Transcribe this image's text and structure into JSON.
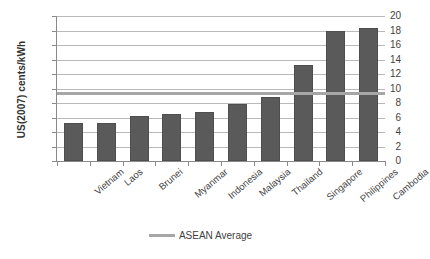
{
  "chart_data": {
    "type": "bar",
    "title": "",
    "xlabel": "",
    "ylabel": "US(2007) cents/kWh",
    "ylim": [
      0,
      20
    ],
    "ytick_step": 2,
    "yticks": [
      20,
      18,
      16,
      14,
      12,
      10,
      8,
      6,
      4,
      2,
      0
    ],
    "grid": true,
    "legend_position": "bottom",
    "categories": [
      "Vietnam",
      "Laos",
      "Brunei",
      "Myanmar",
      "Indonesia",
      "Malaysia",
      "Thailand",
      "Singapore",
      "Philippines",
      "Cambodia"
    ],
    "values": [
      5.2,
      5.3,
      6.2,
      6.5,
      6.7,
      7.8,
      8.8,
      13.2,
      18.0,
      18.3
    ],
    "series": [
      {
        "name": "Electricity tariff",
        "type": "bar",
        "color": "#5a5a5a",
        "values": [
          5.2,
          5.3,
          6.2,
          6.5,
          6.7,
          7.8,
          8.8,
          13.2,
          18.0,
          18.3
        ]
      },
      {
        "name": "ASEAN Average",
        "type": "reference-line",
        "color": "#a6a6a6",
        "value": 9.4
      }
    ],
    "legend": [
      {
        "label": "ASEAN Average",
        "color": "#a6a6a6",
        "marker": "line"
      }
    ]
  },
  "colors": {
    "bar": "#5a5a5a",
    "average_line": "#a6a6a6",
    "gridline": "#b9b9b9",
    "axis": "#8a8a8a",
    "text": "#3f3f3f",
    "background": "#ffffff"
  }
}
